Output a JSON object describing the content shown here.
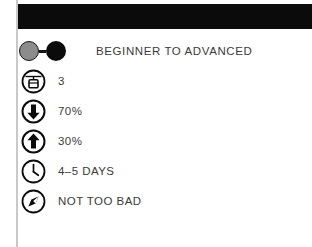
{
  "card": {
    "header_band_color": "#0b0b0b",
    "rule_color": "#c9c9c9",
    "text_color": "#3b3b3b",
    "accent_gray": "#8c8c8c",
    "accent_black": "#0b0b0b"
  },
  "specs": [
    {
      "icon": "difficulty-dots-icon",
      "icon_label": "gray-dot-to-black-dot",
      "value": "BEGINNER TO ADVANCED"
    },
    {
      "icon": "gondola-icon",
      "icon_label": "cable-car-lift",
      "value": "3"
    },
    {
      "icon": "arrow-down-circle-icon",
      "icon_label": "downhill-percentage",
      "value": "70%"
    },
    {
      "icon": "arrow-up-circle-icon",
      "icon_label": "uphill-percentage",
      "value": "30%"
    },
    {
      "icon": "clock-icon",
      "icon_label": "duration",
      "value": "4–5 DAYS"
    },
    {
      "icon": "compass-icon",
      "icon_label": "conditions",
      "value": "NOT TOO BAD"
    }
  ]
}
